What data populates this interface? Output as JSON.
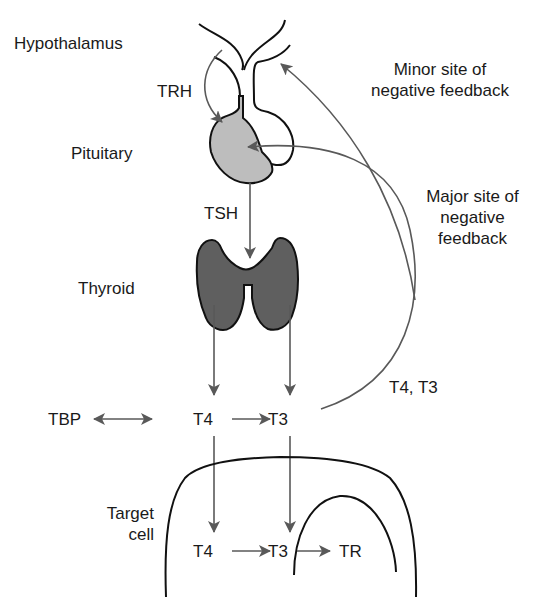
{
  "labels": {
    "hypothalamus": "Hypothalamus",
    "trh": "TRH",
    "pituitary": "Pituitary",
    "tsh": "TSH",
    "thyroid": "Thyroid",
    "minor_feedback_line1": "Minor site of",
    "minor_feedback_line2": "negative feedback",
    "major_feedback_line1": "Major site of",
    "major_feedback_line2": "negative",
    "major_feedback_line3": "feedback",
    "t4_t3_return": "T4, T3",
    "tbp": "TBP",
    "t4_plasma": "T4",
    "t3_plasma": "T3",
    "target_cell_line1": "Target",
    "target_cell_line2": "cell",
    "t4_cell": "T4",
    "t3_cell": "T3",
    "tr": "TR"
  },
  "colors": {
    "arrow": "#595959",
    "outline": "#111111",
    "pituitary_fill": "#bdbdbd",
    "thyroid_fill": "#5f5f5f",
    "text": "#1a1a1a"
  }
}
